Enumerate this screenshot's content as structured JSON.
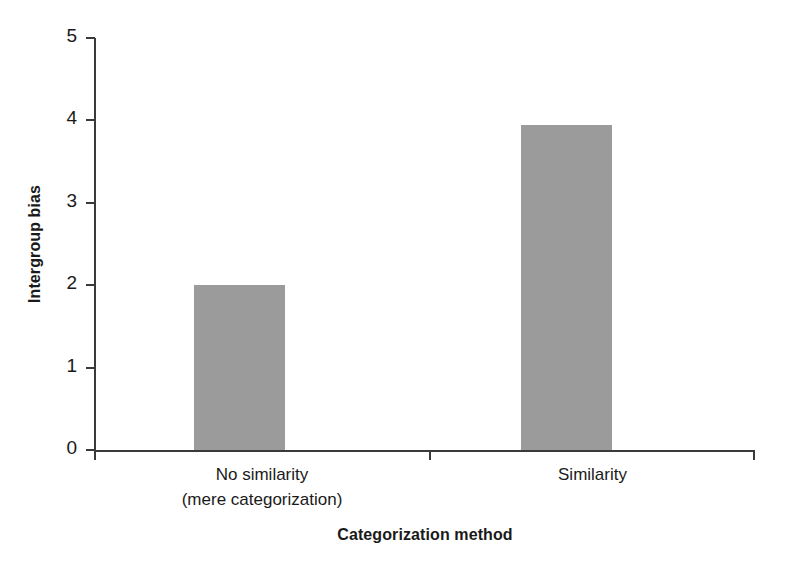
{
  "chart_data": {
    "type": "bar",
    "title": "",
    "xlabel": "Categorization method",
    "ylabel": "Intergroup bias",
    "categories": [
      "No similarity\n(mere categorization)",
      "Similarity"
    ],
    "category_lines": [
      [
        "No similarity",
        "(mere categorization)"
      ],
      [
        "Similarity"
      ]
    ],
    "values": [
      2.0,
      3.95
    ],
    "ylim": [
      0,
      5
    ],
    "ytick_labels": [
      "0",
      "1",
      "2",
      "3",
      "4",
      "5"
    ],
    "ytick_values": [
      0,
      1,
      2,
      3,
      4,
      5
    ],
    "grid": false,
    "legend": false,
    "bar_color": "#9b9b9b",
    "axis_color": "#3a3a3a",
    "text_color": "#1a1a1a"
  },
  "axes": {
    "y_title": "Intergroup bias",
    "x_title": "Categorization method"
  },
  "ticks": {
    "y": [
      {
        "label": "5",
        "value": 5
      },
      {
        "label": "4",
        "value": 4
      },
      {
        "label": "3",
        "value": 3
      },
      {
        "label": "2",
        "value": 2
      },
      {
        "label": "1",
        "value": 1
      },
      {
        "label": "0",
        "value": 0
      }
    ]
  },
  "bars": [
    {
      "name": "no-similarity",
      "value": 2.0,
      "line1": "No similarity",
      "line2": "(mere categorization)"
    },
    {
      "name": "similarity",
      "value": 3.95,
      "line1": "Similarity",
      "line2": ""
    }
  ]
}
